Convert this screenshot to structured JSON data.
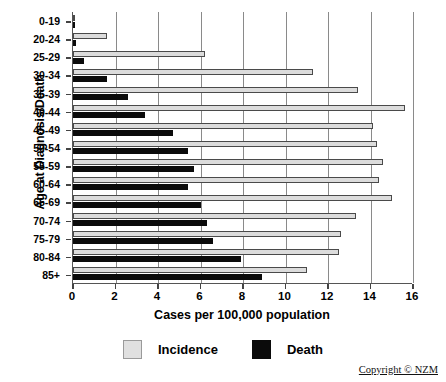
{
  "chart_data": {
    "type": "bar",
    "orientation": "horizontal",
    "title": "",
    "xlabel": "Cases per 100,000 population",
    "ylabel": "Age at Diagnosis/Death",
    "xlim": [
      0,
      16
    ],
    "xticks": [
      0,
      2,
      4,
      6,
      8,
      10,
      12,
      14,
      16
    ],
    "xticklabels": [
      "0",
      "2",
      "4",
      "6",
      "8",
      "10",
      "12",
      "14",
      "16"
    ],
    "grid": "vertical",
    "legend_position": "bottom",
    "categories": [
      "0-19",
      "20-24",
      "25-29",
      "30-34",
      "35-39",
      "40-44",
      "45-49",
      "50-54",
      "55-59",
      "60-64",
      "65-69",
      "70-74",
      "75-79",
      "80-84",
      "85+"
    ],
    "series": [
      {
        "name": "Incidence",
        "color": "#dcdcdc",
        "values": [
          0.1,
          1.6,
          6.2,
          11.3,
          13.4,
          15.6,
          14.1,
          14.3,
          14.6,
          14.4,
          15.0,
          13.3,
          12.6,
          12.5,
          11.0
        ]
      },
      {
        "name": "Death",
        "color": "#0b0b0b",
        "values": [
          0.05,
          0.15,
          0.5,
          1.6,
          2.6,
          3.4,
          4.7,
          5.4,
          5.7,
          5.4,
          6.0,
          6.3,
          6.6,
          7.9,
          8.9
        ]
      }
    ]
  },
  "legend": {
    "items": [
      {
        "label": "Incidence",
        "swatch": "incidence-swatch"
      },
      {
        "label": "Death",
        "swatch": "death-swatch"
      }
    ]
  },
  "footer": {
    "copyright": "Copyright © NZM"
  }
}
